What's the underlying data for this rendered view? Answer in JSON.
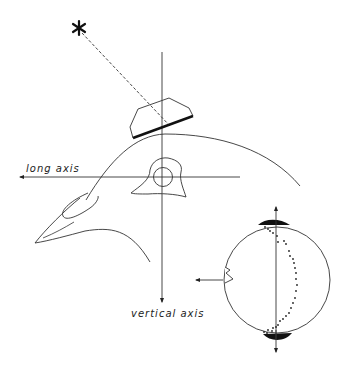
{
  "figure": {
    "labels": {
      "long_axis": "long axis",
      "vertical_axis": "vertical axis"
    },
    "elements": {
      "light_source": "star-icon",
      "light_ray": "dashed line from star to block",
      "block": "polygonal block with thick lower edge",
      "head": "bird head outline in profile",
      "eye": "circular eye within orbit",
      "eyeball": "large circle with dotted curve and dark caps at poles"
    },
    "colors": {
      "ink": "#222222",
      "background": "#ffffff"
    }
  }
}
